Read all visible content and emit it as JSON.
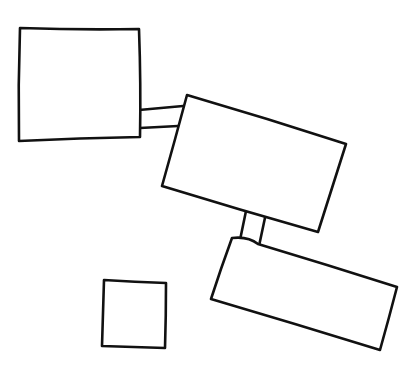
{
  "diagram": {
    "type": "hand-drawn sketch",
    "stroke_color": "#111111",
    "background": "#ffffff",
    "shapes": [
      {
        "id": "square-top-left",
        "kind": "rectangle",
        "points": [
          [
            20,
            28
          ],
          [
            139,
            29
          ],
          [
            140,
            137
          ],
          [
            19,
            141
          ]
        ]
      },
      {
        "id": "rect-middle",
        "kind": "rotated-rectangle",
        "points": [
          [
            187,
            95
          ],
          [
            346,
            144
          ],
          [
            318,
            232
          ],
          [
            162,
            186
          ]
        ]
      },
      {
        "id": "rect-lower-right",
        "kind": "rotated-rectangle",
        "points": [
          [
            232,
            238
          ],
          [
            397,
            287
          ],
          [
            380,
            350
          ],
          [
            211,
            299
          ]
        ]
      },
      {
        "id": "square-bottom-left",
        "kind": "rectangle",
        "points": [
          [
            104,
            280
          ],
          [
            166,
            283
          ],
          [
            165,
            348
          ],
          [
            102,
            346
          ]
        ]
      }
    ],
    "connectors": [
      {
        "id": "connector-square-to-middle",
        "from": "square-top-left",
        "to": "rect-middle",
        "lines": [
          [
            [
              139,
              110
            ],
            [
              183,
              106
            ]
          ],
          [
            [
              140,
              128
            ],
            [
              178,
              126
            ]
          ]
        ]
      },
      {
        "id": "connector-middle-to-lower",
        "from": "rect-middle",
        "to": "rect-lower-right",
        "lines": [
          [
            [
              246,
              211
            ],
            [
              240,
              240
            ]
          ],
          [
            [
              266,
              213
            ],
            [
              259,
              246
            ]
          ]
        ]
      }
    ]
  }
}
